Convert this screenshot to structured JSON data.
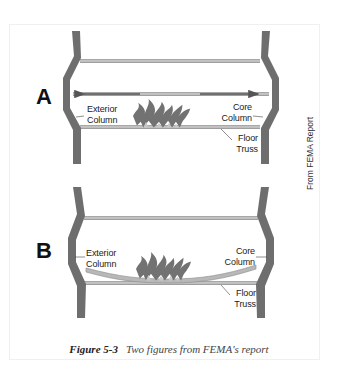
{
  "figure": {
    "caption_number": "Figure 5-3",
    "caption_text": "Two figures from FEMA's report",
    "source_note": "From FEMA Report"
  },
  "panels": [
    {
      "id": "A",
      "letter": "A",
      "labels": {
        "left": "Exterior\nColumn",
        "right": "Core\nColumn",
        "bottom": "Floor\nTruss"
      },
      "state": "thermal expansion of floor truss pushing columns outward"
    },
    {
      "id": "B",
      "letter": "B",
      "labels": {
        "left": "Exterior\nColumn",
        "right": "Core\nColumn",
        "bottom": "Floor\nTruss"
      },
      "state": "sagging floor truss pulling columns inward"
    }
  ],
  "colors": {
    "column": "#6e6e6e",
    "beam": "#b4b4b4",
    "beam_edge": "#8a8a8a",
    "flame": "#707070",
    "flame_light": "#9a9a9a",
    "text": "#1a1a1a"
  }
}
